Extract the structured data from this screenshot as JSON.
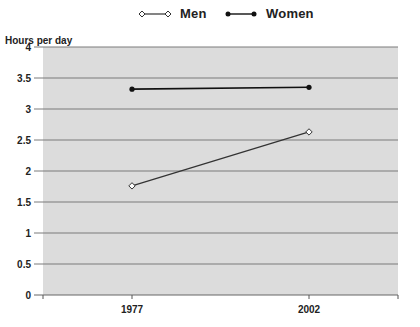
{
  "chart_data": {
    "type": "line",
    "title": "",
    "xlabel": "",
    "ylabel": "Hours per day",
    "categories": [
      "1977",
      "2002"
    ],
    "series": [
      {
        "name": "Men",
        "values": [
          1.76,
          2.63
        ],
        "marker": "open-diamond",
        "color": "#333333"
      },
      {
        "name": "Women",
        "values": [
          3.32,
          3.35
        ],
        "marker": "filled-circle",
        "color": "#111111"
      }
    ],
    "ylim": [
      0,
      4
    ],
    "yticks": [
      "0",
      "0.5",
      "1",
      "1.5",
      "2",
      "2.5",
      "3",
      "3.5",
      "4"
    ],
    "grid": true,
    "legend_position": "top",
    "plot_background": "#dcdcdc",
    "gridline_color": "#7a7a7a"
  },
  "legend": {
    "men_label": "Men",
    "women_label": "Women"
  },
  "axis": {
    "ylabel": "Hours per day"
  }
}
